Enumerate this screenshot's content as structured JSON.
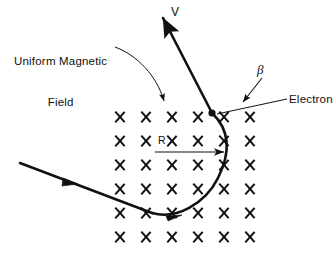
{
  "figure": {
    "title_caption": "",
    "background_color": "#ffffff",
    "ink_color": "#111111",
    "width": 334,
    "height": 263
  },
  "labels": {
    "uniform_field_line1": "Uniform Magnetic",
    "uniform_field_line2": "Field",
    "velocity": "V",
    "angle": "β",
    "electron": "Electron",
    "radius": "R"
  },
  "field_grid": {
    "symbol": "×",
    "symbol_name": "magnetic-field-into-page-cross",
    "columns": 6,
    "rows": 6,
    "origin_x": 120,
    "origin_y": 117,
    "spacing_x": 26,
    "spacing_y": 24,
    "positions": [
      [
        120,
        117
      ],
      [
        146,
        117
      ],
      [
        172,
        117
      ],
      [
        198,
        117
      ],
      [
        224,
        117
      ],
      [
        250,
        117
      ],
      [
        120,
        141
      ],
      [
        146,
        141
      ],
      [
        172,
        141
      ],
      [
        198,
        141
      ],
      [
        224,
        141
      ],
      [
        250,
        141
      ],
      [
        120,
        165
      ],
      [
        146,
        165
      ],
      [
        172,
        165
      ],
      [
        198,
        165
      ],
      [
        224,
        165
      ],
      [
        250,
        165
      ],
      [
        120,
        189
      ],
      [
        146,
        189
      ],
      [
        172,
        189
      ],
      [
        198,
        189
      ],
      [
        224,
        189
      ],
      [
        250,
        189
      ],
      [
        120,
        213
      ],
      [
        146,
        213
      ],
      [
        172,
        213
      ],
      [
        198,
        213
      ],
      [
        224,
        213
      ],
      [
        250,
        213
      ],
      [
        120,
        237
      ],
      [
        146,
        237
      ],
      [
        172,
        237
      ],
      [
        198,
        237
      ],
      [
        224,
        237
      ],
      [
        250,
        237
      ]
    ]
  },
  "geometry": {
    "electron_dot": {
      "x": 212,
      "y": 113,
      "r": 3.4
    },
    "radius_arrow": {
      "x1": 155,
      "y1": 152,
      "x2": 227,
      "y2": 152
    },
    "trajectory_in": {
      "x1": 20,
      "y1": 163,
      "x2": 150,
      "y2": 212
    },
    "trajectory_in_arrow": {
      "x": 70,
      "y": 182
    },
    "velocity_arrow_tip": {
      "x": 163,
      "y": 15
    },
    "field_pointer_from": {
      "x": 115,
      "y": 47
    },
    "field_pointer_to": {
      "x": 166,
      "y": 106
    },
    "beta_arrow_from": {
      "x": 261,
      "y": 77
    },
    "beta_arrow_to": {
      "x": 242,
      "y": 104
    },
    "electron_leader_from": {
      "x": 287,
      "y": 99
    },
    "electron_leader_to": {
      "x": 216,
      "y": 114
    }
  }
}
